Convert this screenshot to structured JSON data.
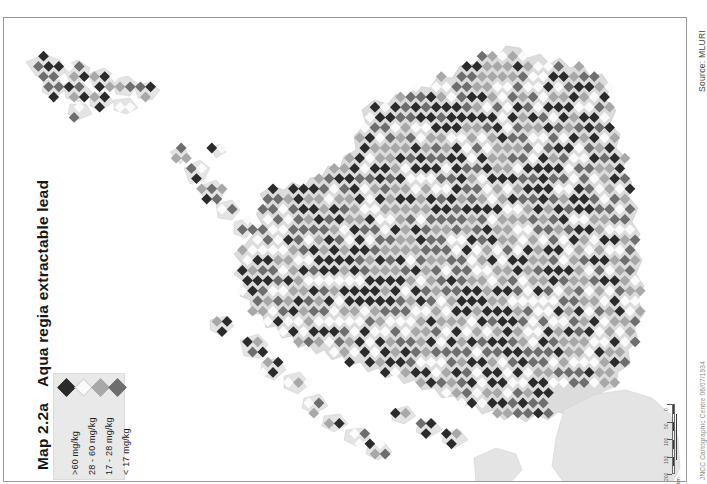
{
  "document": {
    "map_number": "Map 2.2a",
    "title": "Aqua regia extractable lead",
    "source": "Source: MLURI",
    "credit": "JNCC Cartographic Centre 06/07/1934"
  },
  "legend": {
    "name": "concentration-classes",
    "items": [
      {
        "label": ">60 mg/kg",
        "color": "#2b2b2b"
      },
      {
        "label": "28 - 60 mg/kg",
        "color": "#fbfbfb"
      },
      {
        "label": "17 - 28 mg/kg",
        "color": "#a8a8a8"
      },
      {
        "label": "< 17 mg/kg",
        "color": "#6e6e6e"
      }
    ]
  },
  "scalebar": {
    "ticks": [
      "0",
      "50",
      "100",
      "150",
      "200"
    ],
    "units": "km"
  },
  "chart_data": {
    "type": "map",
    "title": "Aqua regia extractable lead",
    "subtitle": "Map 2.2a",
    "variable": "Aqua regia extractable lead",
    "units": "mg/kg",
    "region": "Scotland",
    "symbology": "graduated diamond grid",
    "classes": [
      {
        "label": ">60 mg/kg",
        "min": 60,
        "max": null,
        "color": "#2b2b2b"
      },
      {
        "label": "28 - 60 mg/kg",
        "min": 28,
        "max": 60,
        "color": "#fbfbfb"
      },
      {
        "label": "17 - 28 mg/kg",
        "min": 17,
        "max": 28,
        "color": "#a8a8a8"
      },
      {
        "label": "< 17 mg/kg",
        "min": null,
        "max": 17,
        "color": "#6e6e6e"
      }
    ],
    "source": "MLURI",
    "legend_position": "bottom-left",
    "grid": false
  }
}
